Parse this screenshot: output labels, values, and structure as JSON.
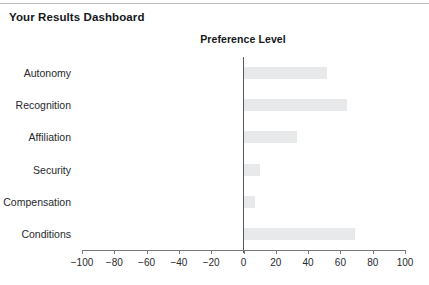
{
  "page": {
    "title": "Your Results Dashboard"
  },
  "chart_data": {
    "type": "bar",
    "orientation": "horizontal",
    "title": "Preference Level",
    "xlabel": "",
    "ylabel": "",
    "categories": [
      "Autonomy",
      "Recognition",
      "Affiliation",
      "Security",
      "Compensation",
      "Conditions"
    ],
    "values": [
      52,
      64,
      33,
      10,
      7,
      69
    ],
    "xlim": [
      -100,
      100
    ],
    "xticks": [
      -100,
      -80,
      -60,
      -40,
      -20,
      0,
      20,
      40,
      60,
      80,
      100
    ],
    "xticklabels": [
      "−100",
      "−80",
      "−60",
      "−40",
      "−20",
      "0",
      "20",
      "40",
      "60",
      "80",
      "100"
    ],
    "grid": false,
    "legend": false,
    "bar_color": "#e7e9ea",
    "axis_color": "#76797c",
    "zero_line_color": "#56595c"
  }
}
